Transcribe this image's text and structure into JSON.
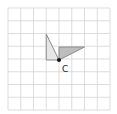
{
  "diagram": {
    "grid": {
      "cells_x": 8,
      "cells_y": 8,
      "line_color": "#d4d4d4"
    },
    "point": {
      "label": "C",
      "color": "#111111"
    },
    "shapes": [
      {
        "name": "triangle-a",
        "fill": "#e6e6e6",
        "stroke": "#8a8a8a"
      },
      {
        "name": "triangle-b",
        "fill": "#bdbdbd",
        "stroke": "#8a8a8a"
      }
    ]
  }
}
